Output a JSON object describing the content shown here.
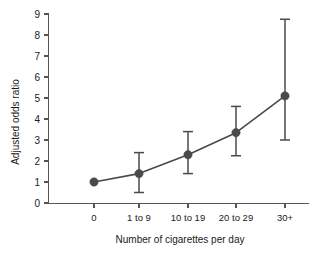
{
  "chart_data": {
    "type": "line",
    "title": "",
    "xlabel": "Number of cigarettes per day",
    "ylabel": "Adjusted odds ratio",
    "categories": [
      "0",
      "1 to 9",
      "10 to 19",
      "20 to 29",
      "30+"
    ],
    "values": [
      1.0,
      1.4,
      2.3,
      3.35,
      5.1
    ],
    "error_low": [
      null,
      0.5,
      1.4,
      2.25,
      3.0
    ],
    "error_high": [
      null,
      2.4,
      3.4,
      4.6,
      8.75
    ],
    "ylim": [
      0,
      9
    ],
    "ytick_labels": [
      "0",
      "1",
      "2",
      "3",
      "4",
      "5",
      "6",
      "7",
      "8",
      "9"
    ],
    "ytick_values": [
      0,
      1,
      2,
      3,
      4,
      5,
      6,
      7,
      8,
      9
    ],
    "grid": false,
    "legend": "none",
    "marker": "filled-circle",
    "series_color": "#4a4a4a",
    "axis_color": "#555555",
    "background_color": "#ffffff"
  },
  "axes": {
    "y_title": "Adjusted odds ratio",
    "x_title": "Number of cigarettes per day"
  },
  "ticks": {
    "y": [
      {
        "label": "9",
        "value": 9
      },
      {
        "label": "8",
        "value": 8
      },
      {
        "label": "7",
        "value": 7
      },
      {
        "label": "6",
        "value": 6
      },
      {
        "label": "5",
        "value": 5
      },
      {
        "label": "4",
        "value": 4
      },
      {
        "label": "3",
        "value": 3
      },
      {
        "label": "2",
        "value": 2
      },
      {
        "label": "1",
        "value": 1
      },
      {
        "label": "0",
        "value": 0
      }
    ],
    "x": [
      {
        "label": "0"
      },
      {
        "label": "1 to 9"
      },
      {
        "label": "10 to 19"
      },
      {
        "label": "20 to 29"
      },
      {
        "label": "30+"
      }
    ]
  }
}
